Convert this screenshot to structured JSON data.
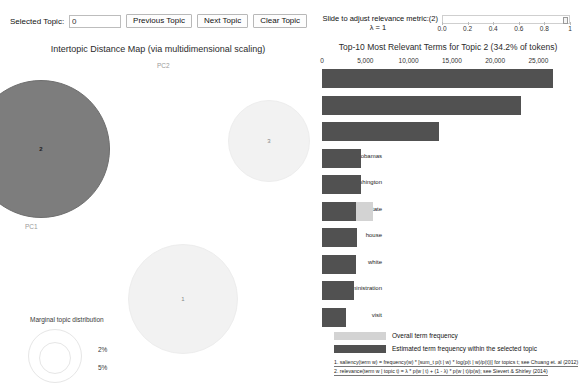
{
  "toolbar": {
    "selected_topic_label": "Selected Topic:",
    "selected_topic_value": "0",
    "previous_topic": "Previous Topic",
    "next_topic": "Next Topic",
    "clear_topic": "Clear Topic"
  },
  "slider": {
    "caption": "Slide to adjust relevance metric:(2)",
    "lambda_label": "λ = 1",
    "value": 1,
    "ticks": [
      "0.0",
      "0.2",
      "0.4",
      "0.6",
      "0.8",
      "1"
    ]
  },
  "left_panel": {
    "title": "Intertopic Distance Map (via multidimensional scaling)",
    "x_axis_label": "PC1",
    "y_axis_label": "PC2",
    "marginal_title": "Marginal topic distribution",
    "marginal_sizes": [
      "2%",
      "5%"
    ],
    "topics": [
      {
        "id": "2",
        "label": "2",
        "x": 40,
        "y": 108,
        "r": 68,
        "selected": true
      },
      {
        "id": "3",
        "label": "3",
        "x": 268,
        "y": 100,
        "r": 40,
        "selected": false
      },
      {
        "id": "1",
        "label": "1",
        "x": 182,
        "y": 258,
        "r": 54,
        "selected": false
      }
    ]
  },
  "chart_data": {
    "type": "bar",
    "title": "Top-10 Most Relevant Terms for Topic 2 (34.2% of tokens)",
    "xlabel": "",
    "ylabel": "",
    "xlim": [
      0,
      26800
    ],
    "ticks": [
      0,
      5000,
      10000,
      15000,
      20000,
      25000
    ],
    "tick_labels": [
      "0",
      "5,000",
      "10,000",
      "15,000",
      "20,000",
      "25,000"
    ],
    "grid": false,
    "legend_position": "bottom",
    "categories": [
      "obama",
      "president",
      "barack",
      "obamas",
      "washington",
      "state",
      "house",
      "white",
      "administration",
      "visit"
    ],
    "series": [
      {
        "name": "Overall term frequency",
        "color": "#d3d3d3",
        "values": [
          26700,
          23000,
          13500,
          4550,
          4550,
          5900,
          4000,
          3900,
          3700,
          2800
        ]
      },
      {
        "name": "Estimated term frequency within the selected topic",
        "color": "#515151",
        "values": [
          26700,
          23000,
          13500,
          4550,
          4550,
          3900,
          4000,
          3900,
          3700,
          2800
        ]
      }
    ]
  },
  "legend": {
    "overall": "Overall term frequency",
    "topic": "Estimated term frequency within the selected topic",
    "footnote1": "1. saliency(term w) = frequency(w) * [sum_t p(t | w) * log(p(t | w)/p(t))] for topics t; see Chuang et. al (2012)",
    "footnote2": "2. relevance(term w | topic t) = λ * p(w | t) + (1 - λ) * p(w | t)/p(w); see Sievert & Shirley (2014)"
  }
}
